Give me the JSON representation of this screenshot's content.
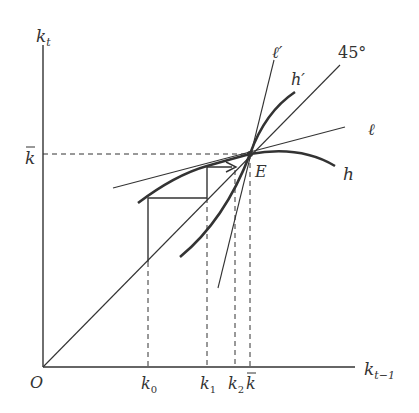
{
  "diagram": {
    "axes": {
      "y_label": "k",
      "y_label_sub": "t",
      "x_label": "k",
      "x_label_sub": "t−1",
      "origin_label": "O"
    },
    "y_ticks": [
      {
        "label": "k",
        "overbar": true
      }
    ],
    "x_ticks": [
      {
        "label": "k",
        "sub": "0"
      },
      {
        "label": "k",
        "sub": "1"
      },
      {
        "label": "k",
        "sub": "2"
      },
      {
        "label": "k",
        "overbar": true
      }
    ],
    "curves": {
      "h": "h",
      "h_prime": "h′",
      "ell": "ℓ",
      "ell_prime": "ℓ′",
      "diag": "45°"
    },
    "equilibrium_label": "E",
    "colors": {
      "ink": "#333333",
      "background": "#ffffff"
    }
  }
}
